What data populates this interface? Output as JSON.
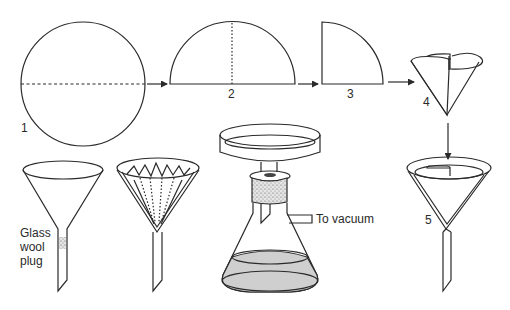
{
  "figure": {
    "steps": [
      {
        "label": "1",
        "shape": "circle",
        "fold": "dashed horizontal diameter"
      },
      {
        "label": "2",
        "shape": "semicircle",
        "fold": "dotted vertical radius"
      },
      {
        "label": "3",
        "shape": "quarter circle"
      },
      {
        "label": "4",
        "shape": "opened cone"
      },
      {
        "label": "5",
        "shape": "cone seated in funnel"
      }
    ],
    "apparatus": {
      "glass_wool_funnel": {
        "label_lines": [
          "Glass",
          "wool",
          "plug"
        ]
      },
      "fluted_filter_funnel": {
        "label": ""
      },
      "buchner_flask": {
        "vacuum_label": "To vacuum"
      }
    },
    "colors": {
      "line": "#2a2a2a",
      "liquid": "#cfcfcf",
      "stopper": "#bdbdbd",
      "background": "#ffffff"
    }
  }
}
